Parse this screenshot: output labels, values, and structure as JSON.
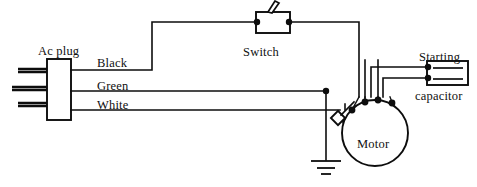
{
  "diagram": {
    "labels": {
      "ac_plug": "Ac plug",
      "black_wire": "Black",
      "green_wire": "Green",
      "white_wire": "White",
      "switch": "Switch",
      "motor": "Motor",
      "starting": "Starting",
      "capacitor": "capacitor"
    },
    "colors": {
      "line": "#0d0d0d",
      "background": "#ffffff",
      "text": "#101010"
    },
    "components": [
      {
        "name": "ac-plug",
        "type": "connector",
        "label": "Ac plug",
        "prongs": 3
      },
      {
        "name": "switch",
        "type": "toggle-switch",
        "label": "Switch",
        "terminals": 2
      },
      {
        "name": "motor",
        "type": "motor",
        "label": "Motor",
        "terminals": 4
      },
      {
        "name": "starting-capacitor",
        "type": "capacitor",
        "label": "Starting capacitor",
        "terminals": 2
      },
      {
        "name": "centrifugal-switch",
        "type": "centrifugal-switch",
        "label": "",
        "terminals": 2
      },
      {
        "name": "earth-ground",
        "type": "ground",
        "label": "",
        "bars": 3
      }
    ],
    "conductors": [
      {
        "name": "black",
        "label": "Black",
        "from": "ac-plug",
        "to": "switch",
        "then": "motor"
      },
      {
        "name": "green",
        "label": "Green",
        "from": "ac-plug",
        "to": "earth-ground"
      },
      {
        "name": "white",
        "label": "White",
        "from": "ac-plug",
        "to": "motor"
      }
    ]
  }
}
